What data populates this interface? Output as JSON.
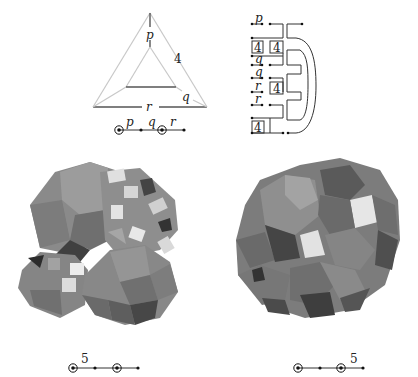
{
  "figure": {
    "triangle_diagram": {
      "labels": {
        "top": "p",
        "right_side": "4",
        "inner_right": "q",
        "bottom": "r"
      },
      "coxeter": {
        "labels": [
          "p",
          "q",
          "r"
        ],
        "ringed_nodes": [
          1,
          3
        ],
        "node_count": 4
      }
    },
    "comb_diagram": {
      "row_labels": [
        "p",
        "",
        "4",
        "q",
        "q",
        "r",
        "r",
        "",
        "4"
      ],
      "box_labels": [
        "4",
        "4",
        "4",
        "4"
      ]
    },
    "polyhedron_left": {
      "description": "grayscale rendered polytope projection",
      "coxeter": {
        "label": "5",
        "ringed_nodes": [
          1,
          3
        ],
        "node_count": 4,
        "label_position": "between-1-2"
      }
    },
    "polyhedron_right": {
      "description": "grayscale rendered polytope projection",
      "coxeter": {
        "label": "5",
        "ringed_nodes": [
          1,
          3
        ],
        "node_count": 4,
        "label_position": "between-3-4"
      }
    }
  }
}
